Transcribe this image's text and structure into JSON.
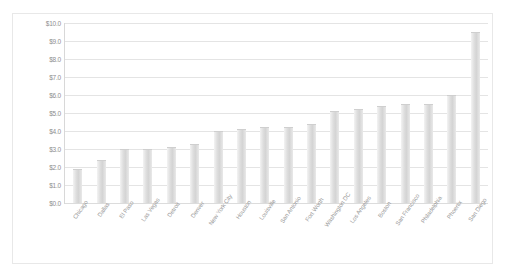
{
  "chart_data": {
    "type": "bar",
    "title": "",
    "subtitle": "",
    "xlabel": "",
    "ylabel": "",
    "ylim": [
      0.0,
      10.0
    ],
    "ytick_step": 1.0,
    "grid": true,
    "legend": false,
    "bar_color": "#dcdcdc",
    "gridline_color": "#e4e4e4",
    "axis_text_color": "#9a9a9a",
    "ytick_labels": [
      "$10.0",
      "$9.0",
      "$8.0",
      "$7.0",
      "$6.0",
      "$5.0",
      "$4.0",
      "$3.0",
      "$2.0",
      "$1.0",
      "$0.0"
    ],
    "ytick_values": [
      10.0,
      9.0,
      8.0,
      7.0,
      6.0,
      5.0,
      4.0,
      3.0,
      2.0,
      1.0,
      0.0
    ],
    "categories": [
      "Chicago",
      "Dallas",
      "El Paso",
      "Las Vegas",
      "Detroit",
      "Denver",
      "New York City",
      "Houston",
      "Louisville",
      "San Antonio",
      "Fort Worth",
      "Washington DC",
      "Los Angeles",
      "Boston",
      "San Francisco",
      "Philadelphia",
      "Phoenix",
      "San Diego"
    ],
    "values": [
      1.9,
      2.4,
      3.0,
      3.0,
      3.1,
      3.3,
      4.0,
      4.1,
      4.2,
      4.2,
      4.4,
      5.1,
      5.2,
      5.4,
      5.5,
      5.5,
      6.0,
      9.5
    ]
  }
}
